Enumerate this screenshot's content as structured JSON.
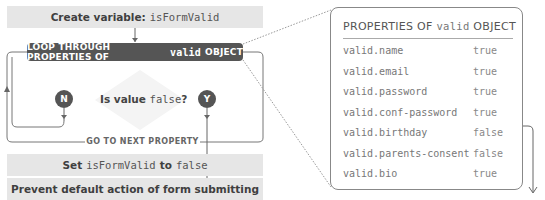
{
  "flow": {
    "create": {
      "prefix": "Create variable:",
      "var": "isFormValid"
    },
    "loop": {
      "prefix": "LOOP THROUGH PROPERTIES OF",
      "var": "valid",
      "suffix": "OBJECT"
    },
    "decision": {
      "prefix": "Is value",
      "value": "false",
      "suffix": "?"
    },
    "no_label": "N",
    "yes_label": "Y",
    "next": "GO TO NEXT PROPERTY",
    "set": {
      "prefix": "Set",
      "var": "isFormValid",
      "mid": "to",
      "value": "false"
    },
    "prevent": "Prevent default action of form submitting"
  },
  "properties": {
    "title_prefix": "PROPERTIES OF",
    "title_var": "valid",
    "title_suffix": "OBJECT",
    "rows": [
      {
        "key": "valid.name",
        "value": "true"
      },
      {
        "key": "valid.email",
        "value": "true"
      },
      {
        "key": "valid.password",
        "value": "true"
      },
      {
        "key": "valid.conf-password",
        "value": "true"
      },
      {
        "key": "valid.birthday",
        "value": "false"
      },
      {
        "key": "valid.parents-consent",
        "value": "false"
      },
      {
        "key": "valid.bio",
        "value": "true"
      }
    ]
  },
  "colors": {
    "box_fill": "#e6e6e6",
    "dark": "#555555",
    "line": "#777777"
  }
}
